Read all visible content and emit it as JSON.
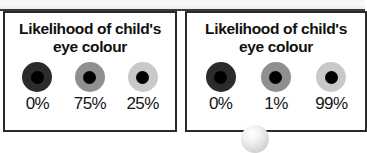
{
  "panels": [
    {
      "id": "left",
      "title_line1": "Likelihood of child's",
      "title_line2": "eye colour",
      "eyes": [
        {
          "iris_shade": "dark",
          "iris_color": "#2b2b2b",
          "pupil_color": "#000000",
          "percent": "0%"
        },
        {
          "iris_shade": "medium",
          "iris_color": "#8f8f8f",
          "pupil_color": "#000000",
          "percent": "75%"
        },
        {
          "iris_shade": "light",
          "iris_color": "#c9c9c9",
          "pupil_color": "#000000",
          "percent": "25%"
        }
      ]
    },
    {
      "id": "right",
      "title_line1": "Likelihood of child's",
      "title_line2": "eye colour",
      "eyes": [
        {
          "iris_shade": "dark",
          "iris_color": "#2b2b2b",
          "pupil_color": "#000000",
          "percent": "0%"
        },
        {
          "iris_shade": "medium",
          "iris_color": "#8f8f8f",
          "pupil_color": "#000000",
          "percent": "1%"
        },
        {
          "iris_shade": "light",
          "iris_color": "#c9c9c9",
          "pupil_color": "#000000",
          "percent": "99%"
        }
      ]
    }
  ],
  "colors": {
    "panel_border": "#2a2a2a",
    "panel_background": "#ffffff",
    "top_rule": "#3c3c3c",
    "text": "#111111"
  }
}
